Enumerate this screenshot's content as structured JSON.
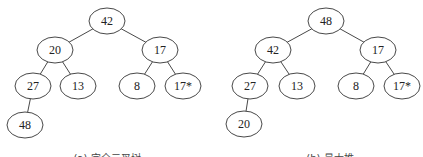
{
  "diagrams": [
    {
      "id": "a",
      "caption": "(a) 完全二叉树",
      "caption_pos": [
        107,
        162
      ],
      "nodes": [
        {
          "id": "n0",
          "label": "42",
          "x": 107,
          "y": 21
        },
        {
          "id": "n1",
          "label": "20",
          "x": 55,
          "y": 50
        },
        {
          "id": "n2",
          "label": "17",
          "x": 160,
          "y": 50
        },
        {
          "id": "n3",
          "label": "27",
          "x": 33,
          "y": 86
        },
        {
          "id": "n4",
          "label": "13",
          "x": 78,
          "y": 86
        },
        {
          "id": "n5",
          "label": "8",
          "x": 137,
          "y": 86
        },
        {
          "id": "n6",
          "label": "17*",
          "x": 183,
          "y": 86
        },
        {
          "id": "n7",
          "label": "48",
          "x": 25,
          "y": 125
        }
      ],
      "edges": [
        [
          "n0",
          "n1"
        ],
        [
          "n0",
          "n2"
        ],
        [
          "n1",
          "n3"
        ],
        [
          "n1",
          "n4"
        ],
        [
          "n2",
          "n5"
        ],
        [
          "n2",
          "n6"
        ],
        [
          "n3",
          "n7"
        ]
      ]
    },
    {
      "id": "b",
      "caption": "(b) 最大堆",
      "caption_pos": [
        330,
        162
      ],
      "nodes": [
        {
          "id": "m0",
          "label": "48",
          "x": 326,
          "y": 21
        },
        {
          "id": "m1",
          "label": "42",
          "x": 273,
          "y": 50
        },
        {
          "id": "m2",
          "label": "17",
          "x": 378,
          "y": 50
        },
        {
          "id": "m3",
          "label": "27",
          "x": 250,
          "y": 86
        },
        {
          "id": "m4",
          "label": "13",
          "x": 297,
          "y": 86
        },
        {
          "id": "m5",
          "label": "8",
          "x": 356,
          "y": 86
        },
        {
          "id": "m6",
          "label": "17*",
          "x": 402,
          "y": 86
        },
        {
          "id": "m7",
          "label": "20",
          "x": 244,
          "y": 124
        }
      ],
      "edges": [
        [
          "m0",
          "m1"
        ],
        [
          "m0",
          "m2"
        ],
        [
          "m1",
          "m3"
        ],
        [
          "m1",
          "m4"
        ],
        [
          "m2",
          "m5"
        ],
        [
          "m2",
          "m6"
        ],
        [
          "m3",
          "m7"
        ]
      ]
    }
  ],
  "style": {
    "node_rx": 18,
    "node_ry": 13,
    "stroke": "#333333",
    "text_color": "#222222"
  }
}
